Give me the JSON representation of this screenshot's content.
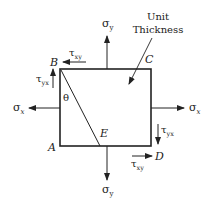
{
  "diagram": {
    "title_note": {
      "line1": "Unit",
      "line2": "Thickness"
    },
    "points": {
      "A": "A",
      "B": "B",
      "C": "C",
      "D": "D",
      "E": "E"
    },
    "angle": "θ",
    "stresses": {
      "sigma_y_top": {
        "base": "σ",
        "sub": "y"
      },
      "sigma_y_bottom": {
        "base": "σ",
        "sub": "y"
      },
      "sigma_x_left": {
        "base": "σ",
        "sub": "x"
      },
      "sigma_x_right": {
        "base": "σ",
        "sub": "x"
      },
      "tau_xy_top": {
        "base": "τ",
        "sub": "xy"
      },
      "tau_yx_left": {
        "base": "τ",
        "sub": "yx"
      },
      "tau_yx_right": {
        "base": "τ",
        "sub": "yx"
      },
      "tau_xy_bottom": {
        "base": "τ",
        "sub": "xy"
      }
    },
    "colors": {
      "line": "#222222",
      "background": "#ffffff"
    }
  }
}
